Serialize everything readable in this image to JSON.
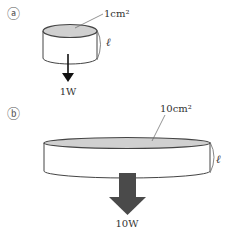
{
  "panels": [
    {
      "marker": "a",
      "marker_glyph": "ⓐ",
      "area_label": "1cm²",
      "length_label": "ℓ",
      "power_label": "1W",
      "arrow": "thin"
    },
    {
      "marker": "b",
      "marker_glyph": "ⓑ",
      "area_label": "10cm²",
      "length_label": "ℓ",
      "power_label": "10W",
      "arrow": "thick"
    }
  ],
  "colors": {
    "outline": "#444444",
    "top_face": "#d0d0d0",
    "side_face": "#ffffff",
    "arrow_thin": "#111111",
    "arrow_thick": "#4a4a4a",
    "text": "#333333"
  }
}
